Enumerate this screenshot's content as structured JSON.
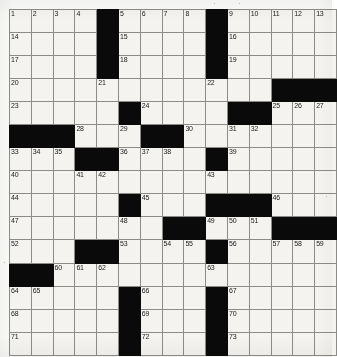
{
  "puzzle": {
    "type": "crossword-grid",
    "rows": 15,
    "cols": 15,
    "colors": {
      "block": "#0a0a0a",
      "cell": "#f4f3f0",
      "grid_line": "#8c8b87",
      "number_text": "#1b1b1b",
      "page_background": "#fbfbfa"
    },
    "grid": [
      [
        {
          "block": false,
          "num": "1"
        },
        {
          "block": false,
          "num": "2"
        },
        {
          "block": false,
          "num": "3"
        },
        {
          "block": false,
          "num": "4"
        },
        {
          "block": true,
          "num": ""
        },
        {
          "block": false,
          "num": "5"
        },
        {
          "block": false,
          "num": "6"
        },
        {
          "block": false,
          "num": "7"
        },
        {
          "block": false,
          "num": "8"
        },
        {
          "block": true,
          "num": ""
        },
        {
          "block": false,
          "num": "9"
        },
        {
          "block": false,
          "num": "10"
        },
        {
          "block": false,
          "num": "11"
        },
        {
          "block": false,
          "num": "12"
        },
        {
          "block": false,
          "num": "13"
        }
      ],
      [
        {
          "block": false,
          "num": "14"
        },
        {
          "block": false,
          "num": ""
        },
        {
          "block": false,
          "num": ""
        },
        {
          "block": false,
          "num": ""
        },
        {
          "block": true,
          "num": ""
        },
        {
          "block": false,
          "num": "15"
        },
        {
          "block": false,
          "num": ""
        },
        {
          "block": false,
          "num": ""
        },
        {
          "block": false,
          "num": ""
        },
        {
          "block": true,
          "num": ""
        },
        {
          "block": false,
          "num": "16"
        },
        {
          "block": false,
          "num": ""
        },
        {
          "block": false,
          "num": ""
        },
        {
          "block": false,
          "num": ""
        },
        {
          "block": false,
          "num": ""
        }
      ],
      [
        {
          "block": false,
          "num": "17"
        },
        {
          "block": false,
          "num": ""
        },
        {
          "block": false,
          "num": ""
        },
        {
          "block": false,
          "num": ""
        },
        {
          "block": true,
          "num": ""
        },
        {
          "block": false,
          "num": "18"
        },
        {
          "block": false,
          "num": ""
        },
        {
          "block": false,
          "num": ""
        },
        {
          "block": false,
          "num": ""
        },
        {
          "block": true,
          "num": ""
        },
        {
          "block": false,
          "num": "19"
        },
        {
          "block": false,
          "num": ""
        },
        {
          "block": false,
          "num": ""
        },
        {
          "block": false,
          "num": ""
        },
        {
          "block": false,
          "num": ""
        }
      ],
      [
        {
          "block": false,
          "num": "20"
        },
        {
          "block": false,
          "num": ""
        },
        {
          "block": false,
          "num": ""
        },
        {
          "block": false,
          "num": ""
        },
        {
          "block": false,
          "num": "21"
        },
        {
          "block": false,
          "num": ""
        },
        {
          "block": false,
          "num": ""
        },
        {
          "block": false,
          "num": ""
        },
        {
          "block": false,
          "num": ""
        },
        {
          "block": false,
          "num": "22"
        },
        {
          "block": false,
          "num": ""
        },
        {
          "block": false,
          "num": ""
        },
        {
          "block": true,
          "num": ""
        },
        {
          "block": true,
          "num": ""
        },
        {
          "block": true,
          "num": ""
        }
      ],
      [
        {
          "block": false,
          "num": "23"
        },
        {
          "block": false,
          "num": ""
        },
        {
          "block": false,
          "num": ""
        },
        {
          "block": false,
          "num": ""
        },
        {
          "block": false,
          "num": ""
        },
        {
          "block": true,
          "num": ""
        },
        {
          "block": false,
          "num": "24"
        },
        {
          "block": false,
          "num": ""
        },
        {
          "block": false,
          "num": ""
        },
        {
          "block": false,
          "num": ""
        },
        {
          "block": true,
          "num": ""
        },
        {
          "block": true,
          "num": ""
        },
        {
          "block": false,
          "num": "25"
        },
        {
          "block": false,
          "num": "26"
        },
        {
          "block": false,
          "num": "27"
        }
      ],
      [
        {
          "block": true,
          "num": ""
        },
        {
          "block": true,
          "num": ""
        },
        {
          "block": true,
          "num": ""
        },
        {
          "block": false,
          "num": "28"
        },
        {
          "block": false,
          "num": ""
        },
        {
          "block": false,
          "num": "29"
        },
        {
          "block": true,
          "num": ""
        },
        {
          "block": true,
          "num": ""
        },
        {
          "block": false,
          "num": "30"
        },
        {
          "block": false,
          "num": ""
        },
        {
          "block": false,
          "num": "31"
        },
        {
          "block": false,
          "num": "32"
        },
        {
          "block": false,
          "num": ""
        },
        {
          "block": false,
          "num": ""
        },
        {
          "block": false,
          "num": ""
        }
      ],
      [
        {
          "block": false,
          "num": "33"
        },
        {
          "block": false,
          "num": "34"
        },
        {
          "block": false,
          "num": "35"
        },
        {
          "block": true,
          "num": ""
        },
        {
          "block": true,
          "num": ""
        },
        {
          "block": false,
          "num": "36"
        },
        {
          "block": false,
          "num": "37"
        },
        {
          "block": false,
          "num": "38"
        },
        {
          "block": false,
          "num": ""
        },
        {
          "block": true,
          "num": ""
        },
        {
          "block": false,
          "num": "39"
        },
        {
          "block": false,
          "num": ""
        },
        {
          "block": false,
          "num": ""
        },
        {
          "block": false,
          "num": ""
        },
        {
          "block": false,
          "num": ""
        }
      ],
      [
        {
          "block": false,
          "num": "40"
        },
        {
          "block": false,
          "num": ""
        },
        {
          "block": false,
          "num": ""
        },
        {
          "block": false,
          "num": "41"
        },
        {
          "block": false,
          "num": "42"
        },
        {
          "block": false,
          "num": ""
        },
        {
          "block": false,
          "num": ""
        },
        {
          "block": false,
          "num": ""
        },
        {
          "block": false,
          "num": ""
        },
        {
          "block": false,
          "num": "43"
        },
        {
          "block": false,
          "num": ""
        },
        {
          "block": false,
          "num": ""
        },
        {
          "block": false,
          "num": ""
        },
        {
          "block": false,
          "num": ""
        },
        {
          "block": false,
          "num": ""
        }
      ],
      [
        {
          "block": false,
          "num": "44"
        },
        {
          "block": false,
          "num": ""
        },
        {
          "block": false,
          "num": ""
        },
        {
          "block": false,
          "num": ""
        },
        {
          "block": false,
          "num": ""
        },
        {
          "block": true,
          "num": ""
        },
        {
          "block": false,
          "num": "45"
        },
        {
          "block": false,
          "num": ""
        },
        {
          "block": false,
          "num": ""
        },
        {
          "block": true,
          "num": ""
        },
        {
          "block": true,
          "num": ""
        },
        {
          "block": true,
          "num": ""
        },
        {
          "block": false,
          "num": "46"
        },
        {
          "block": false,
          "num": ""
        },
        {
          "block": false,
          "num": ""
        }
      ],
      [
        {
          "block": false,
          "num": "47"
        },
        {
          "block": false,
          "num": ""
        },
        {
          "block": false,
          "num": ""
        },
        {
          "block": false,
          "num": ""
        },
        {
          "block": false,
          "num": ""
        },
        {
          "block": false,
          "num": "48"
        },
        {
          "block": false,
          "num": ""
        },
        {
          "block": true,
          "num": ""
        },
        {
          "block": true,
          "num": ""
        },
        {
          "block": false,
          "num": "49"
        },
        {
          "block": false,
          "num": "50"
        },
        {
          "block": false,
          "num": "51"
        },
        {
          "block": true,
          "num": ""
        },
        {
          "block": true,
          "num": ""
        },
        {
          "block": true,
          "num": ""
        }
      ],
      [
        {
          "block": false,
          "num": "52"
        },
        {
          "block": false,
          "num": ""
        },
        {
          "block": false,
          "num": ""
        },
        {
          "block": true,
          "num": ""
        },
        {
          "block": true,
          "num": ""
        },
        {
          "block": false,
          "num": "53"
        },
        {
          "block": false,
          "num": ""
        },
        {
          "block": false,
          "num": "54"
        },
        {
          "block": false,
          "num": "55"
        },
        {
          "block": true,
          "num": ""
        },
        {
          "block": false,
          "num": "56"
        },
        {
          "block": false,
          "num": ""
        },
        {
          "block": false,
          "num": "57"
        },
        {
          "block": false,
          "num": "58"
        },
        {
          "block": false,
          "num": "59"
        }
      ],
      [
        {
          "block": true,
          "num": ""
        },
        {
          "block": true,
          "num": ""
        },
        {
          "block": false,
          "num": "60"
        },
        {
          "block": false,
          "num": "61"
        },
        {
          "block": false,
          "num": "62"
        },
        {
          "block": false,
          "num": ""
        },
        {
          "block": false,
          "num": ""
        },
        {
          "block": false,
          "num": ""
        },
        {
          "block": false,
          "num": ""
        },
        {
          "block": false,
          "num": "63"
        },
        {
          "block": false,
          "num": ""
        },
        {
          "block": false,
          "num": ""
        },
        {
          "block": false,
          "num": ""
        },
        {
          "block": false,
          "num": ""
        },
        {
          "block": false,
          "num": ""
        }
      ],
      [
        {
          "block": false,
          "num": "64"
        },
        {
          "block": false,
          "num": "65"
        },
        {
          "block": false,
          "num": ""
        },
        {
          "block": false,
          "num": ""
        },
        {
          "block": false,
          "num": ""
        },
        {
          "block": true,
          "num": ""
        },
        {
          "block": false,
          "num": "66"
        },
        {
          "block": false,
          "num": ""
        },
        {
          "block": false,
          "num": ""
        },
        {
          "block": true,
          "num": ""
        },
        {
          "block": false,
          "num": "67"
        },
        {
          "block": false,
          "num": ""
        },
        {
          "block": false,
          "num": ""
        },
        {
          "block": false,
          "num": ""
        },
        {
          "block": false,
          "num": ""
        }
      ],
      [
        {
          "block": false,
          "num": "68"
        },
        {
          "block": false,
          "num": ""
        },
        {
          "block": false,
          "num": ""
        },
        {
          "block": false,
          "num": ""
        },
        {
          "block": false,
          "num": ""
        },
        {
          "block": true,
          "num": ""
        },
        {
          "block": false,
          "num": "69"
        },
        {
          "block": false,
          "num": ""
        },
        {
          "block": false,
          "num": ""
        },
        {
          "block": true,
          "num": ""
        },
        {
          "block": false,
          "num": "70"
        },
        {
          "block": false,
          "num": ""
        },
        {
          "block": false,
          "num": ""
        },
        {
          "block": false,
          "num": ""
        },
        {
          "block": false,
          "num": ""
        }
      ],
      [
        {
          "block": false,
          "num": "71"
        },
        {
          "block": false,
          "num": ""
        },
        {
          "block": false,
          "num": ""
        },
        {
          "block": false,
          "num": ""
        },
        {
          "block": false,
          "num": ""
        },
        {
          "block": true,
          "num": ""
        },
        {
          "block": false,
          "num": "72"
        },
        {
          "block": false,
          "num": ""
        },
        {
          "block": false,
          "num": ""
        },
        {
          "block": true,
          "num": ""
        },
        {
          "block": false,
          "num": "73"
        },
        {
          "block": false,
          "num": ""
        },
        {
          "block": false,
          "num": ""
        },
        {
          "block": false,
          "num": ""
        },
        {
          "block": false,
          "num": ""
        }
      ]
    ]
  }
}
